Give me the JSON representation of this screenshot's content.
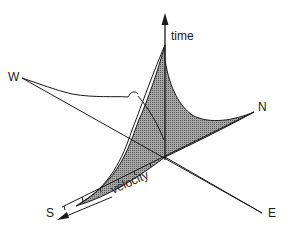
{
  "diagram": {
    "type": "3d-axes-surface",
    "labels": {
      "time": "time",
      "velocity": "velocity",
      "west": "W",
      "north": "N",
      "south": "S",
      "east": "E"
    },
    "colors": {
      "line": "#1a1a1a",
      "surface_fill": "#8c8c8c",
      "background": "#ffffff"
    },
    "velocity_ticks": 7
  }
}
